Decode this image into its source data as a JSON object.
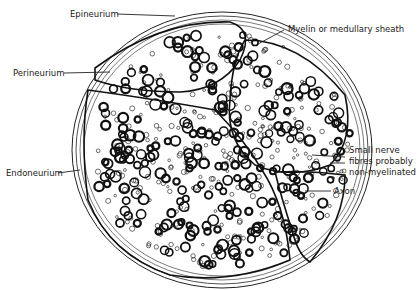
{
  "diagram": {
    "labels": [
      {
        "id": "epineurium",
        "text": "Epineurium"
      },
      {
        "id": "perineurium",
        "text": "Perineurium"
      },
      {
        "id": "endoneurium",
        "text": "Endoneurium"
      },
      {
        "id": "myelin",
        "text": "Myelin or medullary sheath"
      },
      {
        "id": "small_fibres",
        "lines": [
          "Small nerve",
          "fibres probably",
          "non-myelinated"
        ]
      },
      {
        "id": "axon",
        "text": "Axon"
      }
    ],
    "colors": {
      "ink": "#1a1a1a",
      "paper": "#ffffff"
    }
  }
}
